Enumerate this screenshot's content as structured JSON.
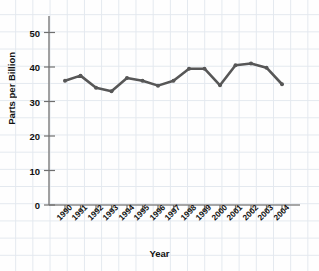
{
  "chart_data": {
    "type": "line",
    "title": "",
    "xlabel": "Year",
    "ylabel": "Parts per Billion",
    "categories": [
      "1990",
      "1991",
      "1992",
      "1993",
      "1994",
      "1995",
      "1996",
      "1997",
      "1998",
      "1999",
      "2000",
      "2001",
      "2002",
      "2003",
      "2004"
    ],
    "values": [
      36.0,
      37.5,
      34.0,
      33.0,
      36.8,
      36.0,
      34.6,
      36.0,
      39.5,
      39.5,
      34.7,
      40.5,
      41.0,
      39.8,
      35.0
    ],
    "series": [
      {
        "name": "Parts per Billion",
        "values": [
          36.0,
          37.5,
          34.0,
          33.0,
          36.8,
          36.0,
          34.6,
          36.0,
          39.5,
          39.5,
          34.7,
          40.5,
          41.0,
          39.8,
          35.0
        ]
      }
    ],
    "ylim": [
      0,
      55
    ],
    "yticks": [
      0,
      10,
      20,
      30,
      40,
      50
    ],
    "ytick_labels": [
      "0",
      "10",
      "20",
      "30",
      "40",
      "50"
    ],
    "xlim": [
      "1990",
      "2004"
    ],
    "grid": "graph-paper-background",
    "legend": "none",
    "line_color": "#575757",
    "marker": "circle",
    "marker_color": "#575757",
    "axis_color": "#7a7a7a",
    "background_color": "#fdfdfd",
    "grid_color": "#cfd8e3"
  },
  "axis": {
    "y_label": "Parts per Billion",
    "x_label": "Year",
    "y_ticks": [
      "50",
      "40",
      "30",
      "20",
      "10",
      "0"
    ],
    "x_ticks": [
      "1990",
      "1991",
      "1992",
      "1993",
      "1994",
      "1995",
      "1996",
      "1997",
      "1998",
      "1999",
      "2000",
      "2001",
      "2002",
      "2003",
      "2004"
    ]
  }
}
